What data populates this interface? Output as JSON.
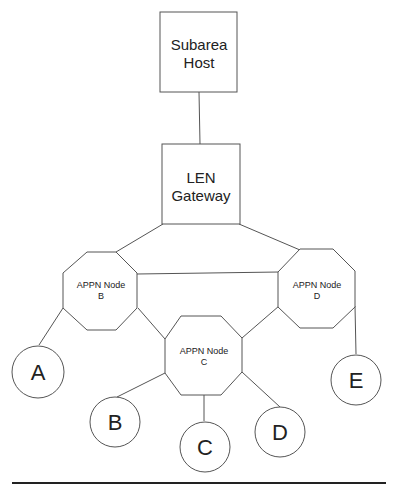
{
  "diagram": {
    "subarea_host": {
      "line1": "Subarea",
      "line2": "Host"
    },
    "len_gateway": {
      "line1": "LEN",
      "line2": "Gateway"
    },
    "appn_nodes": [
      {
        "id": "B",
        "line1": "APPN Node",
        "line2": "B"
      },
      {
        "id": "D",
        "line1": "APPN Node",
        "line2": "D"
      },
      {
        "id": "C",
        "line1": "APPN Node",
        "line2": "C"
      }
    ],
    "end_nodes": [
      {
        "label": "A"
      },
      {
        "label": "B"
      },
      {
        "label": "C"
      },
      {
        "label": "D"
      },
      {
        "label": "E"
      }
    ],
    "colors": {
      "stroke": "#555555",
      "text": "#222222",
      "background": "#ffffff"
    }
  }
}
